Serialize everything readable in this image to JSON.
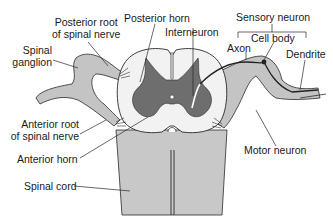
{
  "figure": {
    "type": "anatomical-diagram",
    "colors": {
      "background": "#ffffff",
      "white_matter": "#f2f2f2",
      "gray_matter": "#6e6e6e",
      "nerve_root": "#c4c4c4",
      "spinal_cord_body": "#c8c8c8",
      "outline": "#2a2a2a",
      "neuron_path": "#222222"
    }
  },
  "labels": {
    "posterior_root": [
      "Posterior root",
      "of spinal nerve"
    ],
    "posterior_horn": "Posterior horn",
    "interneuron": "Interneuron",
    "sensory_neuron": "Sensory neuron",
    "cell_body": "Cell body",
    "axon": "Axon",
    "dendrite": "Dendrite",
    "spinal_ganglion": [
      "Spinal",
      "ganglion"
    ],
    "anterior_root": [
      "Anterior root",
      "of spinal nerve"
    ],
    "anterior_horn": "Anterior horn",
    "motor_neuron": "Motor neuron",
    "spinal_cord": "Spinal cord"
  }
}
